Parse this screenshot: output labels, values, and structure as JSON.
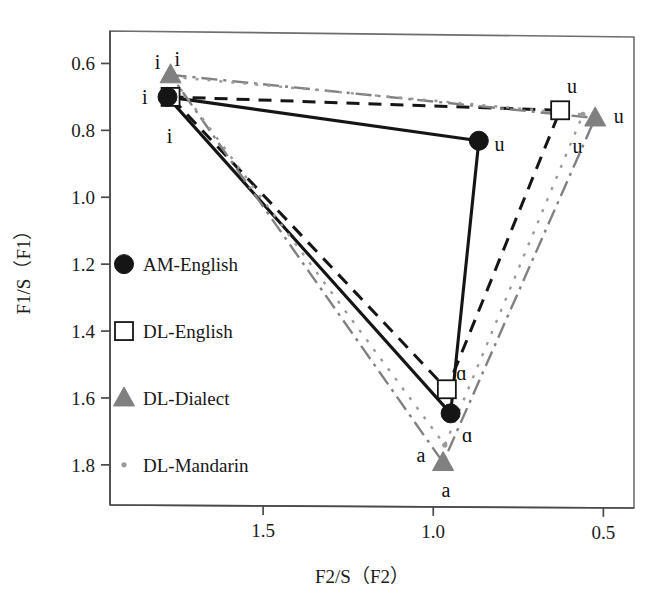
{
  "figure": {
    "title": "",
    "background": "#ffffff"
  },
  "axes": {
    "x": {
      "label": "F2/S（F2）",
      "ticks": [
        "1.5",
        "1.0",
        "0.5"
      ],
      "tick_values": [
        1.5,
        1.0,
        0.5
      ],
      "range": [
        1.95,
        0.41
      ],
      "reversed": true
    },
    "y": {
      "label": "F1/S（F1）",
      "ticks": [
        "0.6",
        "0.8",
        "1.0",
        "1.2",
        "1.4",
        "1.6",
        "1.8"
      ],
      "tick_values": [
        0.6,
        0.8,
        1.0,
        1.2,
        1.4,
        1.6,
        1.8
      ],
      "range": [
        0.5,
        1.92
      ],
      "reversed": true
    }
  },
  "legend": {
    "items": [
      {
        "label": "AM-English",
        "marker": "filled-circle",
        "color": "#151515",
        "line": "solid"
      },
      {
        "label": "DL-English",
        "marker": "open-square",
        "color": "#151515",
        "line": "dashed"
      },
      {
        "label": "DL-Dialect",
        "marker": "filled-triangle",
        "color": "#808080",
        "line": "dash-dot"
      },
      {
        "label": "DL-Mandarin",
        "marker": "small-dot",
        "color": "#9a9a9a",
        "line": "dotted"
      }
    ]
  },
  "chart_data": {
    "type": "scatter",
    "title": "",
    "xlabel": "F2/S（F2）",
    "ylabel": "F1/S（F1）",
    "xlim": [
      1.95,
      0.41
    ],
    "ylim": [
      0.5,
      1.92
    ],
    "x_reversed": true,
    "y_reversed": true,
    "grid": false,
    "legend_position": "left-inside",
    "series": [
      {
        "name": "AM-English",
        "marker": "filled-circle",
        "color": "#151515",
        "line": "solid",
        "points": [
          {
            "vowel": "i",
            "x": 1.781,
            "y": 0.7
          },
          {
            "vowel": "u",
            "x": 0.866,
            "y": 0.831
          },
          {
            "vowel": "ɑ",
            "x": 0.949,
            "y": 1.646
          }
        ]
      },
      {
        "name": "DL-English",
        "marker": "open-square",
        "color": "#151515",
        "line": "dashed",
        "points": [
          {
            "vowel": "i",
            "x": 1.772,
            "y": 0.7
          },
          {
            "vowel": "u",
            "x": 0.627,
            "y": 0.74
          },
          {
            "vowel": "ɑ",
            "x": 0.96,
            "y": 1.574
          }
        ]
      },
      {
        "name": "DL-Dialect",
        "marker": "filled-triangle",
        "color": "#808080",
        "line": "dash-dot",
        "points": [
          {
            "vowel": "i",
            "x": 1.772,
            "y": 0.634
          },
          {
            "vowel": "u",
            "x": 0.524,
            "y": 0.763
          },
          {
            "vowel": "a",
            "x": 0.971,
            "y": 1.793
          }
        ]
      },
      {
        "name": "DL-Mandarin",
        "marker": "small-dot",
        "color": "#9a9a9a",
        "line": "dotted",
        "points": [
          {
            "vowel": "i",
            "x": 1.769,
            "y": 0.64
          },
          {
            "vowel": "u",
            "x": 0.56,
            "y": 0.752
          },
          {
            "vowel": "a",
            "x": 0.966,
            "y": 1.741
          }
        ]
      }
    ],
    "point_annotations": [
      {
        "text": "i",
        "x": 1.848,
        "y": 0.7
      },
      {
        "text": "i",
        "x": 1.81,
        "y": 0.597
      },
      {
        "text": "i",
        "x": 1.752,
        "y": 0.588
      },
      {
        "text": "i",
        "x": 1.775,
        "y": 0.818
      },
      {
        "text": "u",
        "x": 0.805,
        "y": 0.842
      },
      {
        "text": "u",
        "x": 0.576,
        "y": 0.848
      },
      {
        "text": "u",
        "x": 0.592,
        "y": 0.668
      },
      {
        "text": "u",
        "x": 0.455,
        "y": 0.756
      },
      {
        "text": "ɑ",
        "x": 0.917,
        "y": 1.524
      },
      {
        "text": "ɑ",
        "x": 0.9,
        "y": 1.712
      },
      {
        "text": "a",
        "x": 1.036,
        "y": 1.77
      },
      {
        "text": "a",
        "x": 0.963,
        "y": 1.876
      }
    ]
  }
}
